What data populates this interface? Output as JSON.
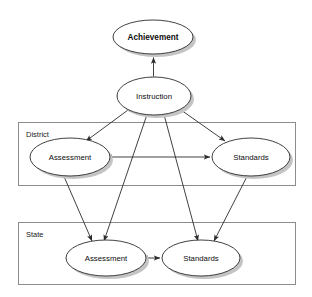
{
  "diagram": {
    "type": "node-link-diagram",
    "background_color": "#ffffff",
    "node_fill": "#ffffff",
    "node_stroke": "#2b2b2b",
    "group_stroke": "#8c8c8c",
    "edge_color": "#2b2b2b",
    "shadow_color": "#bfbfbf"
  },
  "nodes": {
    "achievement": {
      "label": "Achievement",
      "bold": true,
      "cx": 153,
      "cy": 37,
      "rx": 40,
      "ry": 17
    },
    "instruction": {
      "label": "Instruction",
      "bold": false,
      "cx": 154,
      "cy": 96,
      "rx": 37,
      "ry": 19
    },
    "district_assessment": {
      "label": "Assessment",
      "bold": false,
      "cx": 70,
      "cy": 157,
      "rx": 40,
      "ry": 19
    },
    "district_standards": {
      "label": "Standards",
      "bold": false,
      "cx": 251,
      "cy": 157,
      "rx": 39,
      "ry": 19
    },
    "state_assessment": {
      "label": "Assessment",
      "bold": false,
      "cx": 106,
      "cy": 258,
      "rx": 40,
      "ry": 18
    },
    "state_standards": {
      "label": "Standards",
      "bold": false,
      "cx": 201,
      "cy": 258,
      "rx": 39,
      "ry": 18
    }
  },
  "groups": {
    "district": {
      "label": "District",
      "x": 18,
      "y": 122,
      "width": 278,
      "height": 64,
      "label_x": 26,
      "label_y": 134
    },
    "state": {
      "label": "State",
      "x": 18,
      "y": 222,
      "width": 278,
      "height": 63,
      "label_x": 26,
      "label_y": 234
    }
  },
  "edges": [
    {
      "from": "instruction",
      "to": "achievement",
      "arrows": "both"
    },
    {
      "from": "instruction",
      "to": "district_assessment",
      "arrows": "both"
    },
    {
      "from": "instruction",
      "to": "district_standards",
      "arrows": "both"
    },
    {
      "from": "instruction",
      "to": "state_assessment",
      "arrows": "both"
    },
    {
      "from": "instruction",
      "to": "state_standards",
      "arrows": "both"
    },
    {
      "from": "district_assessment",
      "to": "district_standards",
      "arrows": "both"
    },
    {
      "from": "state_assessment",
      "to": "state_standards",
      "arrows": "both"
    },
    {
      "from": "district_assessment",
      "to": "state_assessment",
      "arrows": "both"
    },
    {
      "from": "district_standards",
      "to": "state_standards",
      "arrows": "both"
    }
  ]
}
